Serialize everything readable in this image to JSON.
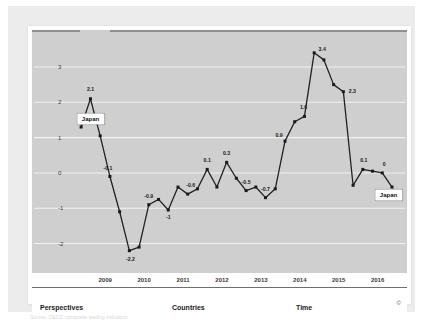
{
  "widget": {
    "copyright_symbol": "©",
    "caption": "Source: OECD composite leading indicators"
  },
  "navbar": {
    "items": [
      {
        "label": "Perspectives"
      },
      {
        "label": "Countries"
      },
      {
        "label": "Time"
      }
    ]
  },
  "callouts": [
    {
      "label": "Japan",
      "x": 2008.62,
      "y": 1.52
    },
    {
      "label": "Japan",
      "x": 2016.28,
      "y": -0.62
    }
  ],
  "chart_data": {
    "type": "line",
    "title": "",
    "subtitle": "",
    "xlabel": "",
    "ylabel": "",
    "series_name": "Japan",
    "line_color": "#222222",
    "marker_color": "#1a1a1a",
    "plot_background": "#cfcfcf",
    "gridline_color": "#f2f2f2",
    "grid": true,
    "legend_position": "none",
    "xlim": [
      2008.3,
      2016.55
    ],
    "ylim": [
      -2.55,
      3.65
    ],
    "yticks": [
      3,
      2,
      1,
      0,
      -1,
      -2
    ],
    "ytick_labels": [
      "3",
      "2",
      "1",
      "0",
      "-1",
      "-2"
    ],
    "xticks": [
      2009,
      2010,
      2011,
      2012,
      2013,
      2014,
      2015,
      2016
    ],
    "xtick_labels": [
      "2009",
      "2010",
      "2011",
      "2012",
      "2013",
      "2014",
      "2015",
      "2016"
    ],
    "x": [
      2008.38,
      2008.62,
      2008.87,
      2009.12,
      2009.37,
      2009.62,
      2009.87,
      2010.12,
      2010.37,
      2010.62,
      2010.87,
      2011.12,
      2011.37,
      2011.62,
      2011.87,
      2012.12,
      2012.37,
      2012.62,
      2012.87,
      2013.12,
      2013.37,
      2013.62,
      2013.87,
      2014.12,
      2014.37,
      2014.62,
      2014.87,
      2015.12,
      2015.37,
      2015.62,
      2015.87,
      2016.12,
      2016.37
    ],
    "values": [
      1.3,
      2.1,
      1.05,
      -0.1,
      -1.1,
      -2.2,
      -2.1,
      -0.9,
      -0.75,
      -1.05,
      -0.4,
      -0.6,
      -0.45,
      0.1,
      -0.4,
      0.3,
      -0.15,
      -0.5,
      -0.4,
      -0.7,
      -0.45,
      0.9,
      1.45,
      1.6,
      3.4,
      3.2,
      2.5,
      2.3,
      -0.35,
      0.1,
      0.05,
      0.0,
      -0.4
    ],
    "point_labels": [
      {
        "x": 2008.62,
        "y": 2.1,
        "text": "2.1",
        "dx": 0,
        "dy": -9
      },
      {
        "x": 2009.12,
        "y": -0.1,
        "text": "-0.1",
        "dx": -2,
        "dy": -8
      },
      {
        "x": 2009.62,
        "y": -2.2,
        "text": "-2.2",
        "dx": 1,
        "dy": 9
      },
      {
        "x": 2010.12,
        "y": -0.9,
        "text": "-0.9",
        "dx": 0,
        "dy": -8
      },
      {
        "x": 2010.62,
        "y": -1.05,
        "text": "-1",
        "dx": 0,
        "dy": 8
      },
      {
        "x": 2011.12,
        "y": -0.6,
        "text": "-0.6",
        "dx": 3,
        "dy": -8
      },
      {
        "x": 2011.62,
        "y": 0.1,
        "text": "0.1",
        "dx": 0,
        "dy": -8
      },
      {
        "x": 2012.12,
        "y": 0.3,
        "text": "0.3",
        "dx": 0,
        "dy": -8
      },
      {
        "x": 2012.62,
        "y": -0.5,
        "text": "-0.5",
        "dx": 0,
        "dy": -8
      },
      {
        "x": 2013.12,
        "y": -0.7,
        "text": "-0.7",
        "dx": 0,
        "dy": -8
      },
      {
        "x": 2013.62,
        "y": 0.9,
        "text": "0.9",
        "dx": -6,
        "dy": -5
      },
      {
        "x": 2014.12,
        "y": 1.6,
        "text": "1.6",
        "dx": -1,
        "dy": -8
      },
      {
        "x": 2014.37,
        "y": 3.4,
        "text": "3.4",
        "dx": 8,
        "dy": -3
      },
      {
        "x": 2015.12,
        "y": 2.3,
        "text": "2.3",
        "dx": 9,
        "dy": 0
      },
      {
        "x": 2015.62,
        "y": 0.1,
        "text": "0.1",
        "dx": 1,
        "dy": -8
      },
      {
        "x": 2016.12,
        "y": 0.0,
        "text": "0",
        "dx": 2,
        "dy": -8
      }
    ]
  }
}
